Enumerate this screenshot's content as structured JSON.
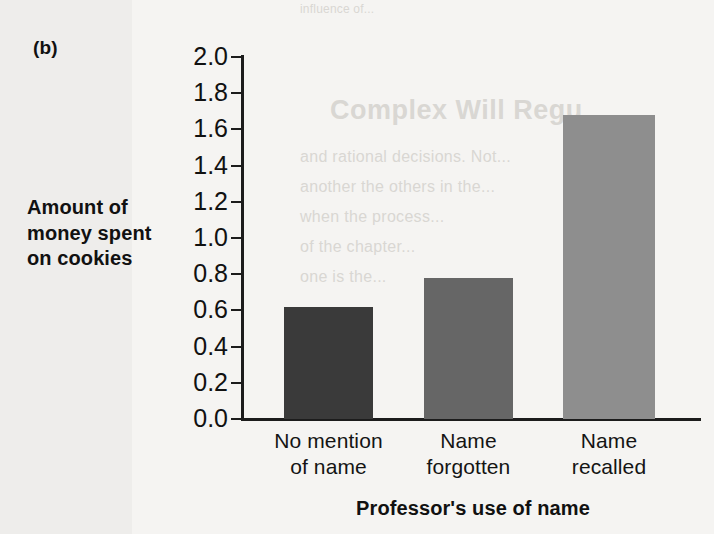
{
  "panel": {
    "label": "(b)"
  },
  "chart_data": {
    "type": "bar",
    "title": "",
    "panel_label": "(b)",
    "categories": [
      "No mention of name",
      "Name forgotten",
      "Name recalled"
    ],
    "category_lines": [
      [
        "No mention",
        "of name"
      ],
      [
        "Name",
        "forgotten"
      ],
      [
        "Name",
        "recalled"
      ]
    ],
    "values": [
      0.62,
      0.78,
      1.68
    ],
    "xlabel": "Professor's use of name",
    "ylabel": "Amount of money spent on cookies",
    "ylabel_lines": [
      "Amount of",
      "money spent",
      "on cookies"
    ],
    "ylim": [
      0.0,
      2.0
    ],
    "ytick_step": 0.2,
    "yticks": [
      "2.0",
      "1.8",
      "1.6",
      "1.4",
      "1.2",
      "1.0",
      "0.8",
      "0.6",
      "0.4",
      "0.2",
      "0.0"
    ],
    "ytick_values": [
      2.0,
      1.8,
      1.6,
      1.4,
      1.2,
      1.0,
      0.8,
      0.6,
      0.4,
      0.2,
      0.0
    ],
    "grid": false,
    "legend": "none",
    "bar_colors": [
      "#3a3a3a",
      "#666666",
      "#8e8e8e"
    ],
    "axis_color": "#1c1c1c",
    "background_color": "#f3f2f0"
  },
  "ghost_text": {
    "top_line": "influence of...",
    "heading": "Complex Will Regu",
    "body_1": "and rational decisions. Not...",
    "body_2": "another the others in the...",
    "body_3": "when the process...",
    "body_4": "of the chapter...",
    "body_5": "one is the..."
  }
}
